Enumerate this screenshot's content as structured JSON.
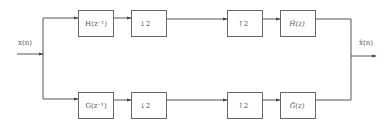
{
  "diagram": {
    "type": "two-channel filter bank",
    "input_label": "x(n)",
    "output_label": "x̂(n)",
    "upper_branch": {
      "analysis_filter": "H(z⁻¹)",
      "downsampler": "↓2",
      "upsampler": "↑2",
      "synthesis_filter": "H̃(z)"
    },
    "lower_branch": {
      "analysis_filter": "G(z⁻¹)",
      "downsampler": "↓2",
      "upsampler": "↑2",
      "synthesis_filter": "G̃(z)"
    },
    "colors": {
      "line": "#555555",
      "box_border": "#666666",
      "text": "#555555",
      "background": "#ffffff"
    }
  }
}
